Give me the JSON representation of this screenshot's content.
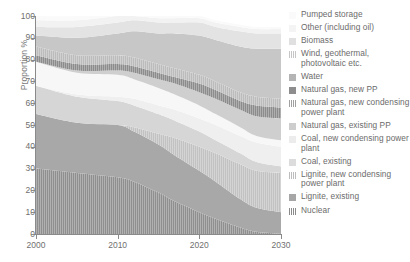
{
  "axes": {
    "ylabel": "Proportion %",
    "yticks": [
      "0",
      "10",
      "20",
      "30",
      "40",
      "50",
      "60",
      "70",
      "80",
      "90",
      "100"
    ],
    "xticks": [
      "2000",
      "2010",
      "2020",
      "2030"
    ]
  },
  "chart_data": {
    "type": "area",
    "title": "",
    "xlabel": "",
    "ylabel": "Proportion %",
    "xlim": [
      2000,
      2030
    ],
    "ylim": [
      0,
      100
    ],
    "grid": false,
    "legend_position": "right",
    "stacked": true,
    "stack_order": "bottom-to-top",
    "x": [
      2000,
      2005,
      2010,
      2012,
      2015,
      2017,
      2020,
      2022,
      2025,
      2027,
      2030
    ],
    "series": [
      {
        "name": "Nuclear",
        "color": "#8f8f8f",
        "pattern": "vertical-hatch",
        "values": [
          30,
          28,
          26,
          24,
          19,
          15,
          10,
          7,
          3,
          1,
          0
        ]
      },
      {
        "name": "Lignite, existing",
        "color": "#a8a8a8",
        "pattern": "solid",
        "values": [
          25,
          23,
          24,
          23,
          22,
          21,
          19,
          17,
          13,
          11,
          10
        ]
      },
      {
        "name": "Lignite, new condensing power plant",
        "color": "#c2c2c2",
        "pattern": "vertical-hatch",
        "values": [
          0,
          0,
          0,
          2,
          5,
          8,
          11,
          13,
          16,
          17,
          18
        ]
      },
      {
        "name": "Coal, existing",
        "color": "#d6d6d6",
        "pattern": "solid",
        "values": [
          13,
          12,
          11,
          10,
          9,
          8,
          7,
          6,
          5,
          4,
          3
        ]
      },
      {
        "name": "Coal, new condensing power plant",
        "color": "#efefef",
        "pattern": "solid",
        "values": [
          0,
          1,
          2,
          3,
          4,
          5,
          6,
          7,
          8,
          9,
          9
        ]
      },
      {
        "name": "Natural gas, existing PP",
        "color": "#f7f7f7",
        "pattern": "solid",
        "values": [
          11,
          10,
          10,
          9,
          8,
          7,
          6,
          5,
          4,
          3,
          3
        ]
      },
      {
        "name": "Natural gas, new condensing power plant",
        "color": "#cfcfcf",
        "pattern": "solid",
        "values": [
          0,
          1,
          2,
          3,
          4,
          5,
          6,
          7,
          8,
          9,
          10
        ]
      },
      {
        "name": "Natural gas, new PP",
        "color": "#8c8c8c",
        "pattern": "vertical-hatch",
        "values": [
          3,
          3,
          3,
          3,
          3,
          3,
          4,
          4,
          4,
          5,
          5
        ]
      },
      {
        "name": "Water",
        "color": "#bcbcbc",
        "pattern": "vertical-hatch",
        "values": [
          4,
          4,
          4,
          4,
          4,
          4,
          4,
          4,
          4,
          4,
          4
        ]
      },
      {
        "name": "Wind, geothermal, photovoltaic etc.",
        "color": "#c7c7c7",
        "pattern": "solid",
        "values": [
          5,
          8,
          10,
          12,
          14,
          16,
          18,
          19,
          21,
          22,
          23
        ]
      },
      {
        "name": "Biomass",
        "color": "#e3e3e3",
        "pattern": "solid",
        "values": [
          4,
          5,
          5,
          5,
          5,
          5,
          6,
          6,
          7,
          7,
          7
        ]
      },
      {
        "name": "Other (including oil)",
        "color": "#f2f2f2",
        "pattern": "solid",
        "values": [
          3,
          3,
          3,
          2,
          2,
          2,
          2,
          2,
          2,
          2,
          2
        ]
      },
      {
        "name": "Pumped storage",
        "color": "#fafafa",
        "pattern": "solid",
        "values": [
          2,
          2,
          2,
          2,
          2,
          1,
          1,
          1,
          1,
          1,
          1
        ]
      }
    ]
  },
  "legend": {
    "items": [
      {
        "label": "Pumped storage",
        "color": "#fafafa",
        "pattern": "solid"
      },
      {
        "label": "Other (including oil)",
        "color": "#f4f4f4",
        "pattern": "solid"
      },
      {
        "label": "Biomass",
        "color": "#e0e0e0",
        "pattern": "solid"
      },
      {
        "label": "Wind, geothermal, photovoltaic etc.",
        "color": "#c6c6c6",
        "pattern": "hatch"
      },
      {
        "label": "Water",
        "color": "#b4b4b4",
        "pattern": "solid"
      },
      {
        "label": "Natural gas, new PP",
        "color": "#8d8d8d",
        "pattern": "solid"
      },
      {
        "label": "Natural gas, new condensing power plant",
        "color": "#a0a0a0",
        "pattern": "hatch"
      },
      {
        "label": "Natural gas, existing PP",
        "color": "#cdcdcd",
        "pattern": "solid"
      },
      {
        "label": "Coal, new condensing power plant",
        "color": "#ececec",
        "pattern": "solid"
      },
      {
        "label": "Coal, existing",
        "color": "#dcdcdc",
        "pattern": "solid"
      },
      {
        "label": "Lignite, new condensing power plant",
        "color": "#bdbdbd",
        "pattern": "hatch"
      },
      {
        "label": "Lignite, existing",
        "color": "#a6a6a6",
        "pattern": "solid"
      },
      {
        "label": "Nuclear",
        "color": "#8a8a8a",
        "pattern": "hatch"
      }
    ]
  }
}
